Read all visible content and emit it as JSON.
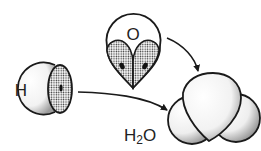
{
  "diagram": {
    "type": "water-molecule-formation",
    "labels": {
      "oxygen": "O",
      "hydrogen": "H",
      "water_prefix": "H",
      "water_subscript": "2",
      "water_suffix": "O"
    },
    "colors": {
      "stroke": "#1a1a1a",
      "background": "#ffffff",
      "stipple": "#555555"
    }
  }
}
